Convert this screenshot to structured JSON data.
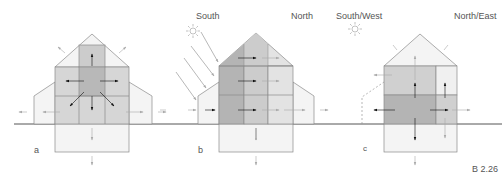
{
  "figure": {
    "id": "B 2.26",
    "panels": [
      {
        "key": "a",
        "label": "a",
        "orientation_labels": []
      },
      {
        "key": "b",
        "label": "b",
        "orientation_labels": [
          "South",
          "North"
        ]
      },
      {
        "key": "c",
        "label": "c",
        "orientation_labels": [
          "South/West",
          "North/East"
        ]
      }
    ]
  },
  "labels": {
    "panel_a": "a",
    "panel_b": "b",
    "panel_c": "c",
    "south": "South",
    "north": "North",
    "south_west": "South/West",
    "north_east": "North/East",
    "figure_number": "B 2.26"
  },
  "icons": {
    "sun_b": "sun-icon",
    "sun_c": "sun-icon"
  },
  "colors": {
    "lightest": "#f4f4f4",
    "light": "#e3e3e3",
    "medium": "#cccccc",
    "dark": "#b4b4b4",
    "outline": "#8a8a8a",
    "ground": "#555555",
    "arrow_dark": "#111111",
    "arrow_light": "#aaaaaa"
  }
}
